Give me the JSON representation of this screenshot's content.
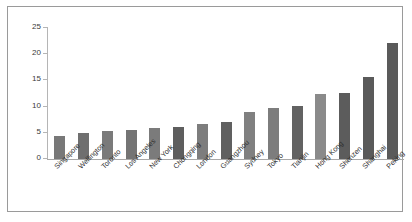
{
  "chart_data": {
    "type": "bar",
    "title": "",
    "subtitle": "",
    "xlabel": "",
    "ylabel": "",
    "ylim": [
      0,
      25
    ],
    "ytick_values": [
      0,
      5,
      10,
      15,
      20,
      25
    ],
    "ytick_labels": [
      "0",
      "5",
      "10",
      "15",
      "20",
      "25"
    ],
    "grid": false,
    "legend": "none",
    "categories": [
      "Singapore",
      "Wellington",
      "Toronto",
      "Los Angeles",
      "New York",
      "Chongqing",
      "London",
      "Guangzhou",
      "Sydney",
      "Tokyo",
      "Tianjin",
      "Hong Kong",
      "Shenzen",
      "Shanghai",
      "Peking"
    ],
    "values": [
      4.3,
      5.0,
      5.4,
      5.6,
      6.0,
      6.2,
      6.7,
      7.1,
      9.0,
      9.8,
      10.2,
      12.4,
      12.6,
      15.7,
      22.2
    ],
    "bar_colors": [
      "#787878",
      "#6f6f6f",
      "#7a7a7a",
      "#747474",
      "#7b7b7b",
      "#5e5e5e",
      "#7d7d7d",
      "#606060",
      "#808080",
      "#7d7d7d",
      "#626262",
      "#8a8a8a",
      "#5c5c5c",
      "#5a5a5a",
      "#5a5a5a"
    ]
  },
  "style": {
    "axis_color": "#b5b5b5",
    "frame_color": "#9a9a9a",
    "text_color": "#2e2e2e",
    "background": "#ffffff"
  }
}
